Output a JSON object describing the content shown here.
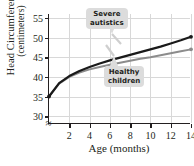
{
  "chart_data": {
    "type": "line",
    "title": "",
    "xlabel": "Age (months)",
    "ylabel_line1": "Head Circumference",
    "ylabel_line2": "(centimeters)",
    "xlim": [
      0,
      14
    ],
    "ylim": [
      28,
      56
    ],
    "yticks": [
      30,
      35,
      40,
      45,
      50,
      55
    ],
    "xticks": [
      2,
      4,
      6,
      8,
      10,
      12,
      14
    ],
    "grid": true,
    "axis_break": true,
    "legend_position": "callout-annotations",
    "series": [
      {
        "name": "Severe autistics",
        "color": "#1a1a1a",
        "x": [
          0,
          1,
          2,
          3,
          4,
          5,
          6,
          7,
          8,
          9,
          10,
          11,
          12,
          13,
          14
        ],
        "values": [
          35.0,
          38.4,
          40.2,
          41.5,
          42.5,
          43.4,
          44.2,
          44.9,
          45.6,
          46.3,
          47.0,
          47.7,
          48.5,
          49.3,
          50.2
        ]
      },
      {
        "name": "Healthy children",
        "color": "#8c8c8c",
        "x": [
          0,
          1,
          2,
          3,
          4,
          5,
          6,
          7,
          8,
          9,
          10,
          11,
          12,
          13,
          14
        ],
        "values": [
          35.0,
          38.3,
          40.0,
          41.1,
          41.9,
          42.5,
          43.1,
          43.6,
          44.1,
          44.6,
          45.0,
          45.5,
          46.0,
          46.5,
          47.0
        ]
      }
    ],
    "annotations": [
      {
        "label_line1": "Severe",
        "label_line2": "autistics",
        "points_to": "Severe autistics"
      },
      {
        "label_line1": "Healthy",
        "label_line2": "children",
        "points_to": "Healthy children"
      }
    ],
    "markers": {
      "start_point": {
        "x": 0,
        "y": 35
      },
      "end_points": [
        {
          "series": "Severe autistics",
          "x": 14,
          "y": 50.2
        },
        {
          "series": "Healthy children",
          "x": 14,
          "y": 47.0
        }
      ]
    }
  },
  "colors": {
    "axis": "#231f20",
    "grid": "#d8d8d8",
    "callout_bg": "#dcdcdc",
    "severe": "#1a1a1a",
    "healthy": "#8c8c8c"
  }
}
